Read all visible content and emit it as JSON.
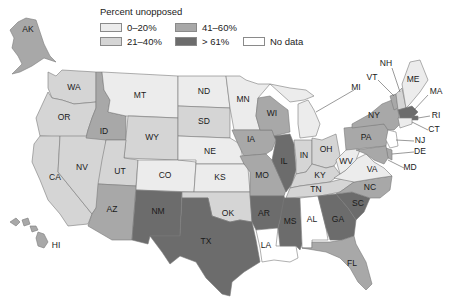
{
  "legend": {
    "title": "Percent unopposed",
    "items": [
      {
        "key": "c1",
        "label": "0–20%",
        "color": "#ececec"
      },
      {
        "key": "c2",
        "label": "21–40%",
        "color": "#d5d5d5"
      },
      {
        "key": "c3",
        "label": "41–60%",
        "color": "#a8a8a8"
      },
      {
        "key": "c4",
        "label": "> 61%",
        "color": "#6c6c6c"
      },
      {
        "key": "nd",
        "label": "No data",
        "color": "#ffffff"
      }
    ]
  },
  "states": {
    "AK": "c3",
    "HI": "c3",
    "WA": "c2",
    "OR": "c2",
    "CA": "c2",
    "NV": "c2",
    "ID": "c3",
    "MT": "c1",
    "WY": "c2",
    "UT": "c2",
    "AZ": "c3",
    "CO": "c1",
    "NM": "c4",
    "ND": "c1",
    "SD": "c2",
    "NE": "c1",
    "KS": "c1",
    "OK": "c2",
    "TX": "c4",
    "MN": "c1",
    "IA": "c3",
    "MO": "c3",
    "AR": "c4",
    "LA": "nd",
    "WI": "c3",
    "IL": "c4",
    "MI": "c1",
    "IN": "c2",
    "OH": "c2",
    "KY": "c2",
    "TN": "c2",
    "MS": "c4",
    "AL": "nd",
    "GA": "c4",
    "FL": "c3",
    "SC": "c4",
    "NC": "c3",
    "VA": "c1",
    "WV": "c1",
    "PA": "c3",
    "NY": "c3",
    "VT": "c3",
    "NH": "c2",
    "ME": "c1",
    "MA": "c4",
    "RI": "c4",
    "CT": "c1",
    "NJ": "nd",
    "DE": "c3",
    "MD": "c3"
  },
  "labels": {
    "AK": "AK",
    "HI": "HI",
    "WA": "WA",
    "OR": "OR",
    "CA": "CA",
    "NV": "NV",
    "ID": "ID",
    "MT": "MT",
    "WY": "WY",
    "UT": "UT",
    "AZ": "AZ",
    "CO": "CO",
    "NM": "NM",
    "ND": "ND",
    "SD": "SD",
    "NE": "NE",
    "KS": "KS",
    "OK": "OK",
    "TX": "TX",
    "MN": "MN",
    "IA": "IA",
    "MO": "MO",
    "AR": "AR",
    "LA": "LA",
    "WI": "WI",
    "IL": "IL",
    "MI": "MI",
    "IN": "IN",
    "OH": "OH",
    "KY": "KY",
    "TN": "TN",
    "MS": "MS",
    "AL": "AL",
    "GA": "GA",
    "FL": "FL",
    "SC": "SC",
    "NC": "NC",
    "VA": "VA",
    "WV": "WV",
    "PA": "PA",
    "NY": "NY",
    "VT": "VT",
    "NH": "NH",
    "ME": "ME",
    "MA": "MA",
    "RI": "RI",
    "CT": "CT",
    "NJ": "NJ",
    "DE": "DE",
    "MD": "MD"
  }
}
